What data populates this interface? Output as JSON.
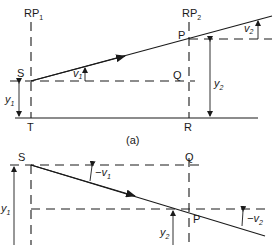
{
  "diagram": {
    "part_a": {
      "caption": "(a)",
      "reference_planes": [
        {
          "label": "RP",
          "sub": "1"
        },
        {
          "label": "RP",
          "sub": "2"
        }
      ],
      "points": {
        "S": "S",
        "Q": "Q",
        "P": "P",
        "T": "T",
        "R": "R"
      },
      "angles": [
        {
          "label": "v",
          "sub": "1"
        },
        {
          "label": "v",
          "sub": "2"
        }
      ],
      "heights": [
        {
          "label": "y",
          "sub": "1"
        },
        {
          "label": "y",
          "sub": "2"
        }
      ]
    },
    "part_b": {
      "points": {
        "S": "S",
        "Q": "Q",
        "P": "P"
      },
      "angles": [
        {
          "label": "−v",
          "sub": "1"
        },
        {
          "label": "−v",
          "sub": "2"
        }
      ],
      "heights": [
        {
          "label": "y",
          "sub": "1"
        },
        {
          "label": "y",
          "sub": "2"
        }
      ]
    }
  }
}
